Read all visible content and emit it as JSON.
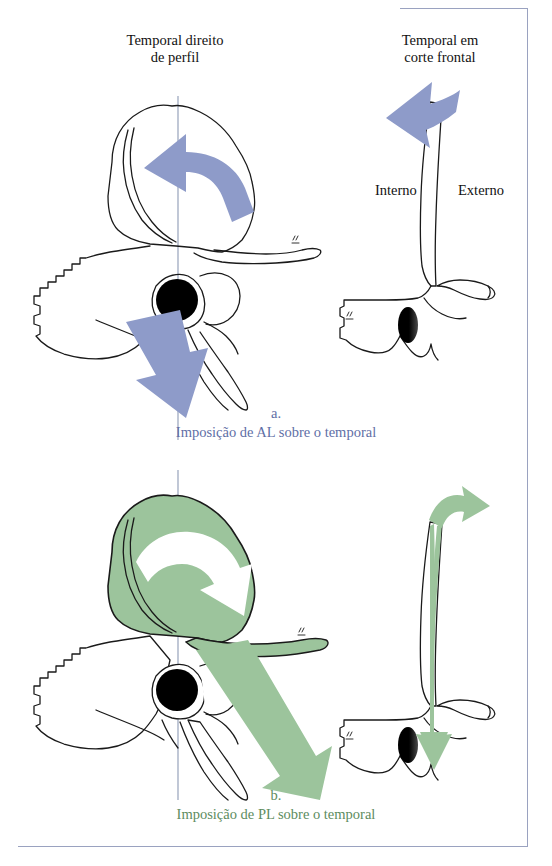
{
  "figure": {
    "language": "pt-BR",
    "headings": {
      "left": {
        "line1": "Temporal direito",
        "line2": "de perfil"
      },
      "right": {
        "line1": "Temporal em",
        "line2": "corte frontal"
      }
    },
    "section_labels": {
      "internal": "Interno",
      "external": "Externo"
    },
    "captions": {
      "a": {
        "letter": "a.",
        "text": "Imposição de AL sobre o temporal"
      },
      "b": {
        "letter": "b.",
        "text": "Imposição de PL sobre o temporal"
      }
    },
    "colors": {
      "blue_arrow": "#8e9bc9",
      "green_arrow": "#94bf94",
      "green_fill": "#9cc49c",
      "caption_blue": "#5f6fa6",
      "caption_green": "#5d8c60",
      "bone_outline": "#1a1a1a",
      "reference_line": "#8d9ab4",
      "frame_rule": "#9aa2c0",
      "meatus_black": "#000000"
    },
    "panels": [
      {
        "id": "a-profile",
        "view": "right temporal bone, lateral profile",
        "arrows": [
          {
            "name": "squama-rotation-arrow",
            "style": "curved",
            "direction": "counter-clockwise, pointing left",
            "color": "#8e9bc9"
          },
          {
            "name": "mastoid-descent-arrow",
            "style": "straight",
            "direction": "down and slightly left",
            "color": "#8e9bc9"
          }
        ]
      },
      {
        "id": "a-frontal",
        "view": "temporal bone, frontal section",
        "arrows": [
          {
            "name": "superior-medial-arrow",
            "style": "straight",
            "direction": "up-left",
            "color": "#8e9bc9"
          }
        ]
      },
      {
        "id": "b-profile",
        "view": "right temporal bone, lateral profile",
        "arrows": [
          {
            "name": "squama-rotation-arrow",
            "style": "curved",
            "direction": "clockwise, pointing down-right",
            "color": "#ffffff"
          },
          {
            "name": "mastoid-descent-arrow",
            "style": "straight",
            "direction": "down and right",
            "color": "#94bf94"
          }
        ]
      },
      {
        "id": "b-frontal",
        "view": "temporal bone, frontal section",
        "arrows": [
          {
            "name": "descending-arrow",
            "style": "hooked",
            "direction": "down along squama",
            "color": "#94bf94"
          }
        ]
      }
    ]
  }
}
